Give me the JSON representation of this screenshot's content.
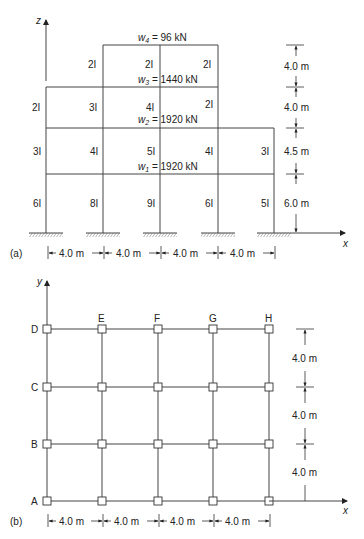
{
  "figure_a": {
    "label": "(a)",
    "axis_z": "z",
    "axis_x": "x",
    "loads": {
      "w4": {
        "sym": "w",
        "sub": "4",
        "value": " = 96 kN"
      },
      "w3": {
        "sym": "w",
        "sub": "3",
        "value": " = 1440 kN"
      },
      "w2": {
        "sym": "w",
        "sub": "2",
        "value": " = 1920 kN"
      },
      "w1": {
        "sym": "w",
        "sub": "1",
        "value": " = 1920 kN"
      }
    },
    "stiffness": {
      "story4": [
        "2I",
        "2I",
        "2I"
      ],
      "story3": [
        "2I",
        "3I",
        "4I",
        "2I"
      ],
      "story2": [
        "3I",
        "4I",
        "5I",
        "4I",
        "3I"
      ],
      "story1": [
        "6I",
        "8I",
        "9I",
        "6I",
        "5I"
      ]
    },
    "heights": [
      "4.0 m",
      "4.0 m",
      "4.5 m",
      "6.0 m"
    ],
    "bays": [
      "4.0 m",
      "4.0 m",
      "4.0 m",
      "4.0 m"
    ]
  },
  "figure_b": {
    "label": "(b)",
    "axis_y": "y",
    "axis_x": "x",
    "row_labels": [
      "D",
      "C",
      "B",
      "A"
    ],
    "col_labels": [
      "E",
      "F",
      "G",
      "H"
    ],
    "spacings_y": [
      "4.0 m",
      "4.0 m",
      "4.0 m"
    ],
    "bays": [
      "4.0 m",
      "4.0 m",
      "4.0 m",
      "4.0 m"
    ]
  }
}
